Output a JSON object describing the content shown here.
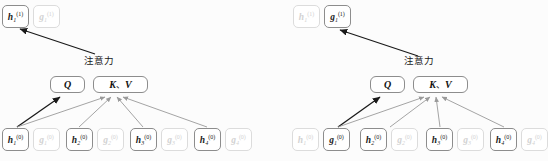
{
  "figure": {
    "background_color": "#fcfcfc",
    "active_color": "#1b1b1b",
    "faded_color": "#d2d2d2",
    "arrow_dark_color": "#1a1a1a",
    "arrow_light_color": "#9a9a9a",
    "box_border_color": "#8d8d8d"
  },
  "panels": [
    {
      "id": "left",
      "name": "attention-panel-h",
      "attention_label": "注意力",
      "qkv": {
        "q_label": "Q",
        "kv_k": "K",
        "kv_comma": "、",
        "kv_v": "V"
      },
      "output_nodes": [
        {
          "name": "h",
          "base": "h",
          "sub": "1",
          "sup": "(1)",
          "state": "active"
        },
        {
          "name": "g",
          "base": "g",
          "sub": "1",
          "sup": "(1)",
          "state": "faded"
        }
      ],
      "input_nodes": [
        {
          "name": "h",
          "base": "h",
          "sub": "1",
          "sup": "(0)",
          "state": "active"
        },
        {
          "name": "g",
          "base": "g",
          "sub": "1",
          "sup": "(0)",
          "state": "faded"
        },
        {
          "name": "h",
          "base": "h",
          "sub": "2",
          "sup": "(0)",
          "state": "active"
        },
        {
          "name": "g",
          "base": "g",
          "sub": "2",
          "sup": "(0)",
          "state": "faded"
        },
        {
          "name": "h",
          "base": "h",
          "sub": "3",
          "sup": "(0)",
          "state": "active"
        },
        {
          "name": "g",
          "base": "g",
          "sub": "3",
          "sup": "(0)",
          "state": "faded"
        },
        {
          "name": "h",
          "base": "h",
          "sub": "4",
          "sup": "(0)",
          "state": "active"
        },
        {
          "name": "g",
          "base": "g",
          "sub": "4",
          "sup": "(0)",
          "state": "faded"
        }
      ],
      "query_source": "h1(0)"
    },
    {
      "id": "right",
      "name": "attention-panel-g",
      "attention_label": "注意力",
      "qkv": {
        "q_label": "Q",
        "kv_k": "K",
        "kv_comma": "、",
        "kv_v": "V"
      },
      "output_nodes": [
        {
          "name": "h",
          "base": "h",
          "sub": "1",
          "sup": "(1)",
          "state": "faded"
        },
        {
          "name": "g",
          "base": "g",
          "sub": "1",
          "sup": "(1)",
          "state": "active"
        }
      ],
      "input_nodes": [
        {
          "name": "h",
          "base": "h",
          "sub": "1",
          "sup": "(0)",
          "state": "faded"
        },
        {
          "name": "g",
          "base": "g",
          "sub": "1",
          "sup": "(0)",
          "state": "active"
        },
        {
          "name": "h",
          "base": "h",
          "sub": "2",
          "sup": "(0)",
          "state": "active"
        },
        {
          "name": "g",
          "base": "g",
          "sub": "2",
          "sup": "(0)",
          "state": "faded"
        },
        {
          "name": "h",
          "base": "h",
          "sub": "3",
          "sup": "(0)",
          "state": "active"
        },
        {
          "name": "g",
          "base": "g",
          "sub": "3",
          "sup": "(0)",
          "state": "faded"
        },
        {
          "name": "h",
          "base": "h",
          "sub": "4",
          "sup": "(0)",
          "state": "active"
        },
        {
          "name": "g",
          "base": "g",
          "sub": "4",
          "sup": "(0)",
          "state": "faded"
        }
      ],
      "query_source": "g1(0)"
    }
  ]
}
